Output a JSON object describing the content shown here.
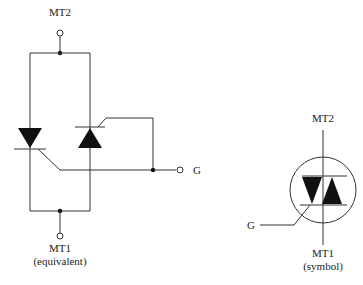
{
  "equivalent": {
    "mt2_label": "MT2",
    "mt1_label": "MT1",
    "caption": "(equivalent)",
    "gate_label": "G"
  },
  "symbol": {
    "mt2_label": "MT2",
    "mt1_label": "MT1",
    "caption": "(symbol)",
    "gate_label": "G"
  },
  "colors": {
    "line": "#333333",
    "fill": "#111111",
    "background": "#ffffff"
  }
}
